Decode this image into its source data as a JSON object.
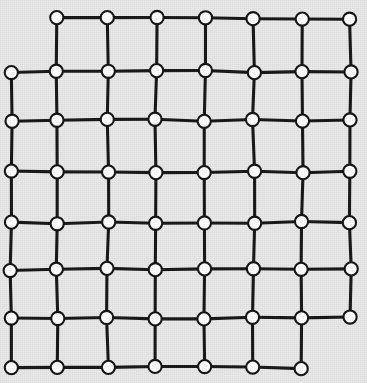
{
  "figure": {
    "kind": "node-link-diagram",
    "background_color": "#e8e8e8",
    "edge_color": "#141414",
    "node_fill_color": "#ffffff",
    "node_stroke_color": "#101010"
  },
  "graph": {
    "type": "grid-lattice",
    "rows": 8,
    "columns": 8,
    "node_count": 62,
    "edge_count": 110,
    "node_radius": 6.6,
    "node_stroke_width": 2.1,
    "edge_stroke_width": 3.1,
    "missing_nodes": [
      {
        "row": 0,
        "col": 0
      },
      {
        "row": 7,
        "col": 7
      }
    ],
    "row_y": [
      18,
      71,
      121,
      172,
      222,
      270,
      318,
      367
    ],
    "col_x": [
      11,
      58,
      107,
      156,
      205,
      253,
      302,
      351
    ],
    "row_jitter": [
      0,
      1,
      -1,
      0,
      1,
      -1,
      0,
      1
    ],
    "col_jitter": [
      0,
      -1,
      1,
      0,
      -1,
      1,
      0,
      -1
    ]
  }
}
